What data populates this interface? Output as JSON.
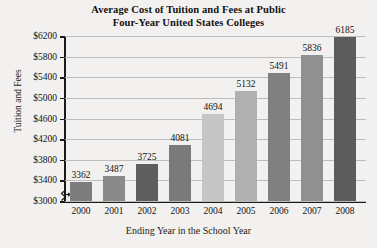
{
  "chart_data": {
    "type": "bar",
    "title": "Average Cost of Tuition and Fees at Public Four-Year United States Colleges",
    "title_line1": "Average Cost of Tuition and Fees at Public",
    "title_line2": "Four-Year United States Colleges",
    "xlabel": "Ending Year in the School Year",
    "ylabel": "Tuition and Fees",
    "categories": [
      "2000",
      "2001",
      "2002",
      "2003",
      "2004",
      "2005",
      "2006",
      "2007",
      "2008"
    ],
    "values": [
      3362,
      3487,
      3725,
      4081,
      4694,
      5132,
      5491,
      5836,
      6185
    ],
    "value_labels": [
      "3362",
      "3487",
      "3725",
      "4081",
      "4694",
      "5132",
      "5491",
      "5836",
      "6185"
    ],
    "bar_colors": [
      "#7d7d7d",
      "#8a8a8a",
      "#5e5e5e",
      "#7a7a7a",
      "#c6c6c6",
      "#b0b0b0",
      "#808080",
      "#909090",
      "#5c5c5c"
    ],
    "ylim": [
      3000,
      6200
    ],
    "ytick_labels": [
      "$3000",
      "$3400",
      "$3800",
      "$4200",
      "$4600",
      "$5000",
      "$5400",
      "$5800",
      "$6200"
    ],
    "ytick_values": [
      3000,
      3400,
      3800,
      4200,
      4600,
      5000,
      5400,
      5800,
      6200
    ],
    "grid": true,
    "legend": null,
    "axis_break": true,
    "background_color": "#f2f1ef",
    "axis_color": "#1a1a1a",
    "grid_color": "#bdbdbd"
  }
}
